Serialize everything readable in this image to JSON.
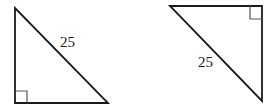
{
  "figure": {
    "triangles": [
      {
        "id": "left",
        "orientation": "right angle at bottom-left",
        "vertices": [
          [
            15,
            8
          ],
          [
            15,
            103
          ],
          [
            108,
            103
          ]
        ],
        "right_angle_corner": [
          15,
          103
        ],
        "hypotenuse_label": "25",
        "label_pos": [
          60,
          47
        ]
      },
      {
        "id": "right",
        "orientation": "right angle at top-right",
        "vertices": [
          [
            170,
            6
          ],
          [
            262,
            6
          ],
          [
            262,
            101
          ]
        ],
        "right_angle_corner": [
          262,
          6
        ],
        "hypotenuse_label": "25",
        "label_pos": [
          198,
          67
        ]
      }
    ],
    "stroke_color": "#1a1a1a"
  }
}
